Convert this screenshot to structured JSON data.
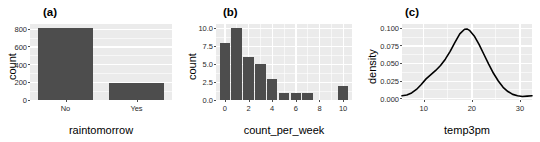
{
  "figure": {
    "panels": [
      "a",
      "b",
      "c"
    ],
    "background": "#ffffff",
    "panel_fill": "#ebebeb",
    "grid_color": "#ffffff",
    "bar_color": "#4d4d4d",
    "line_color": "#000000"
  },
  "panel_a": {
    "tag": "(a)",
    "xlabel": "raintomorrow",
    "ylabel": "count",
    "ytick_labels": [
      "0",
      "200",
      "400",
      "600",
      "800"
    ],
    "xtick_labels": [
      "No",
      "Yes"
    ]
  },
  "panel_b": {
    "tag": "(b)",
    "xlabel": "count_per_week",
    "ylabel": "count",
    "ytick_labels": [
      "0.0",
      "2.5",
      "5.0",
      "7.5",
      "10.0"
    ],
    "xtick_labels": [
      "0",
      "2",
      "4",
      "6",
      "8",
      "10"
    ]
  },
  "panel_c": {
    "tag": "(c)",
    "xlabel": "temp3pm",
    "ylabel": "density",
    "ytick_labels": [
      "0.000",
      "0.025",
      "0.050",
      "0.075",
      "0.100"
    ],
    "xtick_labels": [
      "10",
      "20",
      "30"
    ]
  },
  "chart_data": [
    {
      "type": "bar",
      "panel": "a",
      "title": "(a)",
      "xlabel": "raintomorrow",
      "ylabel": "count",
      "categories": [
        "No",
        "Yes"
      ],
      "values": [
        810,
        190
      ],
      "ylim": [
        0,
        860
      ],
      "yticks": [
        0,
        200,
        400,
        600,
        800
      ],
      "grid": true,
      "legend": "none"
    },
    {
      "type": "bar",
      "panel": "b",
      "title": "(b)",
      "xlabel": "count_per_week",
      "ylabel": "count",
      "categories": [
        0,
        1,
        2,
        3,
        4,
        5,
        6,
        7,
        8,
        9,
        10
      ],
      "values": [
        8,
        10,
        6,
        5,
        3,
        1,
        1,
        1,
        0,
        0,
        2
      ],
      "ylim": [
        0,
        10.6
      ],
      "yticks": [
        0.0,
        2.5,
        5.0,
        7.5,
        10.0
      ],
      "xticks": [
        0,
        2,
        4,
        6,
        8,
        10
      ],
      "grid": true,
      "legend": "none"
    },
    {
      "type": "line",
      "panel": "c",
      "title": "(c)",
      "xlabel": "temp3pm",
      "ylabel": "density",
      "xlim": [
        5.5,
        32.5
      ],
      "ylim": [
        -0.002,
        0.106
      ],
      "yticks": [
        0.0,
        0.025,
        0.05,
        0.075,
        0.1
      ],
      "xticks": [
        10,
        20,
        30
      ],
      "grid": true,
      "legend": "none",
      "series": [
        {
          "name": "density",
          "x": [
            5.5,
            6.5,
            7.5,
            8.5,
            9.5,
            10.5,
            11.5,
            12.5,
            13.5,
            14.5,
            15.5,
            16.5,
            17.5,
            18.5,
            19.0,
            19.5,
            20.5,
            21.5,
            22.5,
            23.5,
            24.5,
            25.5,
            26.5,
            27.5,
            28.5,
            29.5,
            30.5,
            31.5,
            32.5
          ],
          "y": [
            0.004,
            0.005,
            0.008,
            0.013,
            0.02,
            0.028,
            0.034,
            0.04,
            0.047,
            0.056,
            0.067,
            0.08,
            0.092,
            0.0985,
            0.099,
            0.097,
            0.089,
            0.077,
            0.063,
            0.049,
            0.036,
            0.025,
            0.016,
            0.01,
            0.006,
            0.004,
            0.003,
            0.0035,
            0.004
          ]
        }
      ]
    }
  ]
}
